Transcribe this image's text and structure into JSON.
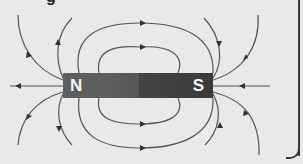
{
  "diagram": {
    "title_fragment": "g",
    "magnet": {
      "north_label": "N",
      "south_label": "S",
      "north_color": "#5e5e5e",
      "south_color": "#3c3c3c"
    },
    "field_line_color": "#555555",
    "background": "#e9e9e9"
  }
}
